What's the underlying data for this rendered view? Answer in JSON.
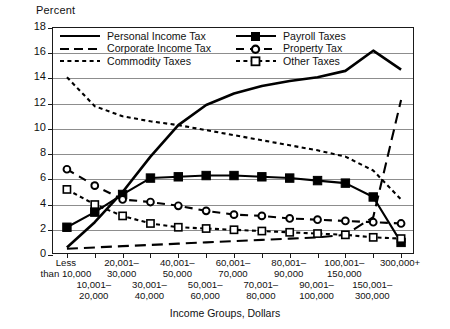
{
  "chart_data": {
    "type": "line",
    "title": "",
    "ylabel": "Percent",
    "xlabel": "Income Groups, Dollars",
    "ylim": [
      0,
      18
    ],
    "yticks": [
      0,
      2,
      4,
      6,
      8,
      10,
      12,
      14,
      16,
      18
    ],
    "grid": true,
    "legend_position": "top-inside",
    "categories": [
      "Less than 10,000",
      "10,001– 20,000",
      "20,001– 30,000",
      "30,001– 40,000",
      "40,001– 50,000",
      "50,001– 60,000",
      "60,001– 70,000",
      "70,001– 80,000",
      "80,001– 90,000",
      "90,001– 100,000",
      "100,001– 150,000",
      "150,001– 300,000",
      "300,000+"
    ],
    "category_labels_top": [
      "Less than\n10,000",
      "20,001–\n30,000",
      "40,001–\n50,000",
      "60,001–\n70,000",
      "80,001–\n90,000",
      "100,001–\n150,000",
      "300,000+"
    ],
    "category_labels_bottom": [
      "10,001–\n20,000",
      "30,001–\n40,000",
      "50,001–\n60,000",
      "70,001–\n80,000",
      "90,001–\n100,000",
      "150,001–\n300,000"
    ],
    "series": [
      {
        "name": "Personal Income Tax",
        "style": "solid",
        "marker": "none",
        "values": [
          0.6,
          2.6,
          5.0,
          7.8,
          10.3,
          11.9,
          12.8,
          13.4,
          13.8,
          14.1,
          14.6,
          16.2,
          14.7
        ]
      },
      {
        "name": "Corporate Income Tax",
        "style": "dashed-long",
        "marker": "none",
        "values": [
          0.5,
          0.6,
          0.7,
          0.8,
          0.9,
          1.0,
          1.1,
          1.2,
          1.3,
          1.4,
          1.6,
          3.0,
          12.3
        ]
      },
      {
        "name": "Commodity Taxes",
        "style": "dotted",
        "marker": "none",
        "values": [
          14.1,
          11.8,
          11.0,
          10.6,
          10.3,
          9.9,
          9.5,
          9.1,
          8.7,
          8.3,
          7.8,
          6.7,
          4.4
        ]
      },
      {
        "name": "Payroll Taxes",
        "style": "solid",
        "marker": "square-filled",
        "values": [
          2.2,
          3.4,
          4.8,
          6.1,
          6.2,
          6.3,
          6.3,
          6.2,
          6.1,
          5.9,
          5.7,
          4.6,
          1.0
        ]
      },
      {
        "name": "Property Tax",
        "style": "dashed",
        "marker": "circle-open",
        "values": [
          6.8,
          5.5,
          4.4,
          4.2,
          3.9,
          3.5,
          3.2,
          3.1,
          2.9,
          2.8,
          2.7,
          2.6,
          2.5
        ]
      },
      {
        "name": "Other Taxes",
        "style": "dotted",
        "marker": "square-open",
        "values": [
          5.2,
          4.0,
          3.1,
          2.5,
          2.2,
          2.1,
          2.0,
          1.9,
          1.8,
          1.7,
          1.6,
          1.4,
          1.3
        ]
      }
    ]
  },
  "legend": {
    "row1": [
      {
        "label": "Personal Income Tax",
        "key": "solid-line"
      },
      {
        "label": "Payroll Taxes",
        "key": "solid-square-line"
      }
    ],
    "row2": [
      {
        "label": "Corporate Income Tax",
        "key": "dashed-line"
      },
      {
        "label": "Property Tax",
        "key": "dashed-circle-line"
      }
    ],
    "row3": [
      {
        "label": "Commodity Taxes",
        "key": "dotted-line"
      },
      {
        "label": "Other Taxes",
        "key": "dotted-square-line"
      }
    ]
  },
  "colors": {
    "line": "#000000",
    "grid": "#8d8d8d",
    "frame": "#1a1a1a",
    "background": "#ffffff"
  }
}
